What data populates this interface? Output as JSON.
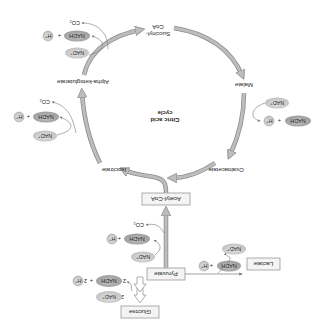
{
  "diagram": {
    "orientation_degrees": 180,
    "title": {
      "line1": "Citric acid",
      "line2": "cycle"
    },
    "colors": {
      "arrow_fill": "#bdbdbd",
      "arrow_stroke": "#8a8a8a",
      "pill_fill": "#d2d2d2",
      "pill_dark_fill": "#a9a9a9",
      "box_stroke": "#999999",
      "box_fill": "#f4f4f4",
      "text": "#222222"
    },
    "boxes": {
      "glucose": "Glucose",
      "pyruvate": "Pyruvate",
      "acetyl_coa": "Acetyl-CoA",
      "lactate": "Lactate"
    },
    "cycle_intermediates": {
      "isocitrate": "Isocitrate",
      "alpha_ketoglutarate": "Alpha-ketoglutarate",
      "succinyl_coa_line1": "Succinyl-",
      "succinyl_coa_line2": "CoA",
      "malate": "Malate",
      "oxaloacetate": "Oxaloacetate"
    },
    "cofactors": {
      "glycolysis": {
        "nad": "NAD⁺",
        "nad_coef": "2",
        "nadh": "NADH",
        "nadh_coef": "2",
        "plus": "+",
        "h_coef": "2",
        "h": "H⁺"
      },
      "pyruvate_dehydrogenase": {
        "nad": "NAD⁺",
        "nadh": "NADH",
        "plus": "+",
        "h": "H⁺",
        "co2": "CO₂"
      },
      "lactate_dehydrogenase": {
        "nadh": "NADH",
        "plus": "+",
        "h": "H⁺",
        "nad": "NAD⁺"
      },
      "isocitrate_dehydrogenase": {
        "nad": "NAD⁺",
        "nadh": "NADH",
        "plus": "+",
        "h": "H⁺",
        "co2": "CO₂"
      },
      "alpha_kg_dehydrogenase": {
        "nad": "NAD⁺",
        "nadh": "NADH",
        "plus": "+",
        "h": "H⁺",
        "co2": "CO₂"
      },
      "malate_dehydrogenase": {
        "nad": "NAD⁺",
        "nadh": "NADH",
        "plus": "+",
        "h": "H⁺"
      }
    }
  }
}
